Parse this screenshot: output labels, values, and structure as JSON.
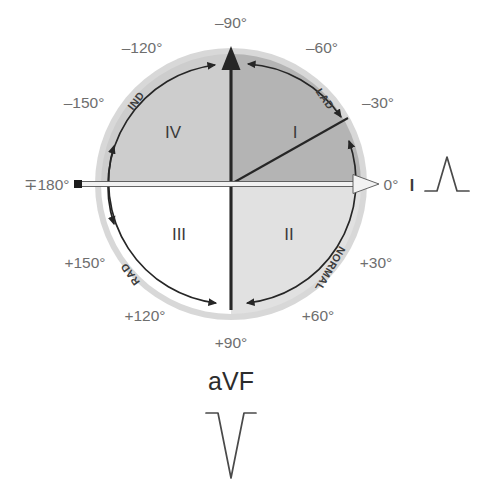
{
  "figure": {
    "center": {
      "x": 231,
      "y": 184
    },
    "radius": 136,
    "colors": {
      "quadrant_I": "#b7b7b7",
      "quadrant_II": "#e2e2e2",
      "quadrant_III": "#ffffff",
      "quadrant_IV": "#cfcfcf",
      "halo": "#d9d9d9",
      "axis_dark": "#262626",
      "axis_light": "#f2f2f2",
      "label_gray": "#6e6e6e",
      "text_dark": "#2c2c2c",
      "background": "#ffffff"
    }
  },
  "degree_labels": [
    {
      "name": "minus-90",
      "text": "‒90°",
      "x": 231,
      "y": 28,
      "anchor": "middle"
    },
    {
      "name": "minus-120",
      "text": "‒120°",
      "x": 142,
      "y": 53,
      "anchor": "middle"
    },
    {
      "name": "minus-60",
      "text": "‒60°",
      "x": 322,
      "y": 53,
      "anchor": "middle"
    },
    {
      "name": "minus-150",
      "text": "‒150°",
      "x": 84,
      "y": 108,
      "anchor": "middle"
    },
    {
      "name": "minus-30",
      "text": "‒30°",
      "x": 378,
      "y": 108,
      "anchor": "middle"
    },
    {
      "name": "plus-minus-180",
      "text": "∓180°",
      "x": 52,
      "y": 190,
      "anchor": "middle"
    },
    {
      "name": "zero",
      "text": "0°",
      "x": 391,
      "y": 190,
      "anchor": "middle"
    },
    {
      "name": "plus-150",
      "text": "+150°",
      "x": 85,
      "y": 268,
      "anchor": "middle"
    },
    {
      "name": "plus-30",
      "text": "+30°",
      "x": 376,
      "y": 268,
      "anchor": "middle"
    },
    {
      "name": "plus-120",
      "text": "+120°",
      "x": 145,
      "y": 321,
      "anchor": "middle"
    },
    {
      "name": "plus-60",
      "text": "+60°",
      "x": 318,
      "y": 321,
      "anchor": "middle"
    },
    {
      "name": "plus-90",
      "text": "+90°",
      "x": 231,
      "y": 348,
      "anchor": "middle"
    }
  ],
  "quadrant_labels": [
    {
      "name": "quadrant-IV",
      "text": "IV",
      "x": 173,
      "y": 138
    },
    {
      "name": "quadrant-I",
      "text": "I",
      "x": 295,
      "y": 138
    },
    {
      "name": "quadrant-III",
      "text": "III",
      "x": 179,
      "y": 240
    },
    {
      "name": "quadrant-II",
      "text": "II",
      "x": 289,
      "y": 240
    }
  ],
  "zone_labels": [
    {
      "name": "zone-ind",
      "text": "IND",
      "x": 139,
      "y": 103,
      "rotation": -52
    },
    {
      "name": "zone-lad",
      "text": "LAD",
      "x": 322,
      "y": 101,
      "rotation": 55
    },
    {
      "name": "zone-rad",
      "text": "RAD",
      "x": 133,
      "y": 272,
      "rotation": -126
    },
    {
      "name": "zone-normal",
      "text": "NORMAL",
      "x": 327,
      "y": 267,
      "rotation": 120
    }
  ],
  "lead_traces": {
    "lead_I": {
      "label": "I",
      "label_x": 411,
      "label_y": 190,
      "polarity": "positive",
      "description": "upright QRS complex"
    },
    "lead_aVF": {
      "label": "aVF",
      "label_x": 231,
      "label_y": 390,
      "polarity": "negative",
      "description": "downward QRS complex"
    }
  },
  "arcs": [
    {
      "name": "arc-ind",
      "from_deg": -180,
      "to_deg": -90,
      "zone": "IND",
      "arrow_ends": "both"
    },
    {
      "name": "arc-lad",
      "from_deg": -90,
      "to_deg": -30,
      "zone": "LAD",
      "arrow_ends": "both"
    },
    {
      "name": "arc-normal",
      "from_deg": -30,
      "to_deg": 90,
      "zone": "NORMAL",
      "arrow_ends": "both"
    },
    {
      "name": "arc-rad",
      "from_deg": 90,
      "to_deg": 180,
      "zone": "RAD",
      "arrow_ends": "both"
    }
  ]
}
